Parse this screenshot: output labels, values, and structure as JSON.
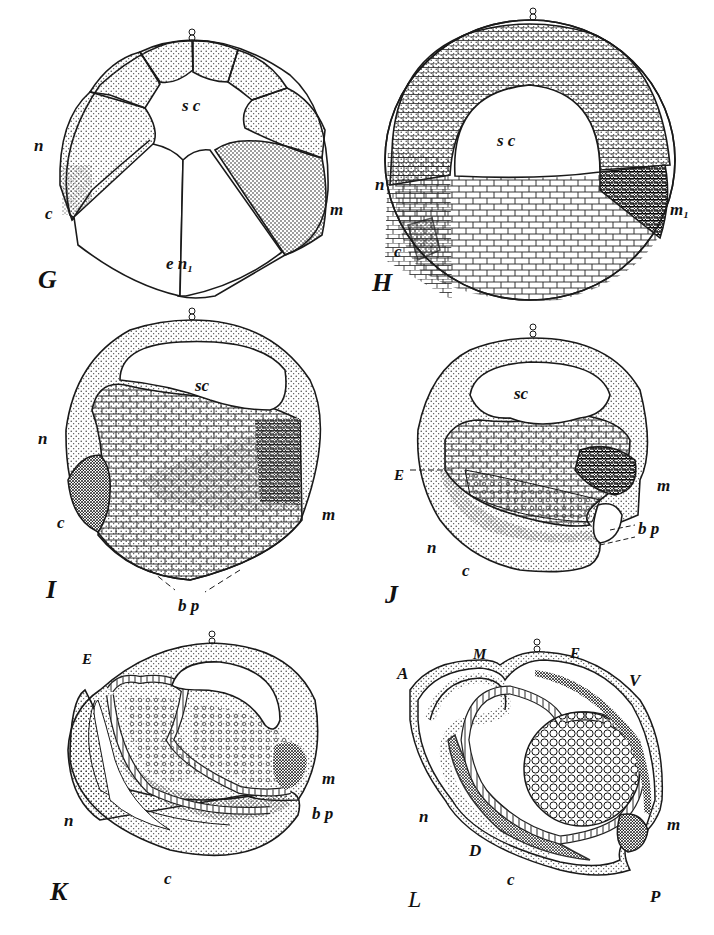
{
  "plate": {
    "title": "Embryonic development stages G–L (cleavage, gastrulation, early embryo)",
    "colors": {
      "ink": "#1a1a1a",
      "paper": "#ffffff",
      "stipple_light": "#d9d9d9",
      "stipple_mid": "#b5b5b5",
      "stipple_dark": "#555555"
    }
  },
  "figures": [
    {
      "id": "G",
      "letter": "G",
      "labels": {
        "sc": "s c",
        "n": "n",
        "c": "c",
        "m": "m",
        "en": "e n₁"
      }
    },
    {
      "id": "H",
      "letter": "H",
      "labels": {
        "sc": "s c",
        "n": "n",
        "c": "c",
        "m": "m₁"
      }
    },
    {
      "id": "I",
      "letter": "I",
      "labels": {
        "sc": "sc",
        "n": "n",
        "c": "c",
        "m": "m",
        "bp": "b p"
      }
    },
    {
      "id": "J",
      "letter": "J",
      "labels": {
        "sc": "sc",
        "E": "E",
        "m": "m",
        "bp": "b p",
        "n": "n",
        "c": "c"
      }
    },
    {
      "id": "K",
      "letter": "K",
      "labels": {
        "E": "E",
        "m": "m",
        "bp": "b p",
        "n": "n",
        "c": "c"
      }
    },
    {
      "id": "L",
      "letter": "L",
      "labels": {
        "A": "A",
        "M": "M",
        "E": "E",
        "V": "V",
        "m": "m",
        "n": "n",
        "D": "D",
        "c": "c",
        "P": "P"
      }
    }
  ]
}
